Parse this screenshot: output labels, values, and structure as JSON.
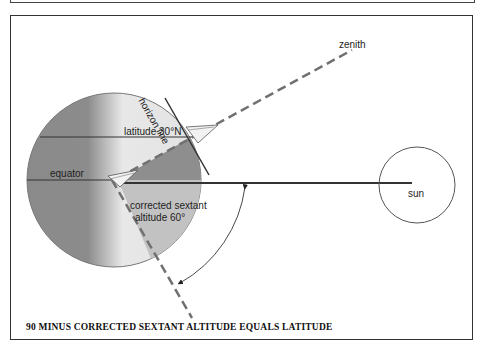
{
  "diagram": {
    "labels": {
      "zenith": "zenith",
      "horizon_line": "horizon line",
      "latitude": "latitude 30°N",
      "equator": "equator",
      "corrected_sextant_line1": "corrected sextant",
      "corrected_sextant_line2": "altitude 60°",
      "sun": "sun"
    },
    "caption": "90 MINUS CORRECTED SEXTANT ALTITUDE EQUALS LATITUDE",
    "colors": {
      "earth_dark": "#8a8a8a",
      "earth_light": "#e6e6e6",
      "lower_wedge": "#bdbdbd",
      "dashed_line": "#707070",
      "line": "#333333"
    }
  }
}
